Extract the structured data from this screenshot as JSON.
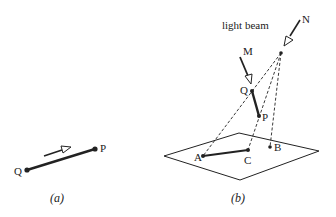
{
  "figure_a": {
    "caption": "(a)",
    "points": {
      "Q": "Q",
      "P": "P"
    }
  },
  "figure_b": {
    "caption": "(b)",
    "beam_label": "light beam",
    "points": {
      "N": "N",
      "M": "M",
      "Q": "Q",
      "P": "P",
      "A": "A",
      "B": "B",
      "C": "C"
    }
  },
  "colors": {
    "line": "#222222",
    "background": "#ffffff"
  }
}
